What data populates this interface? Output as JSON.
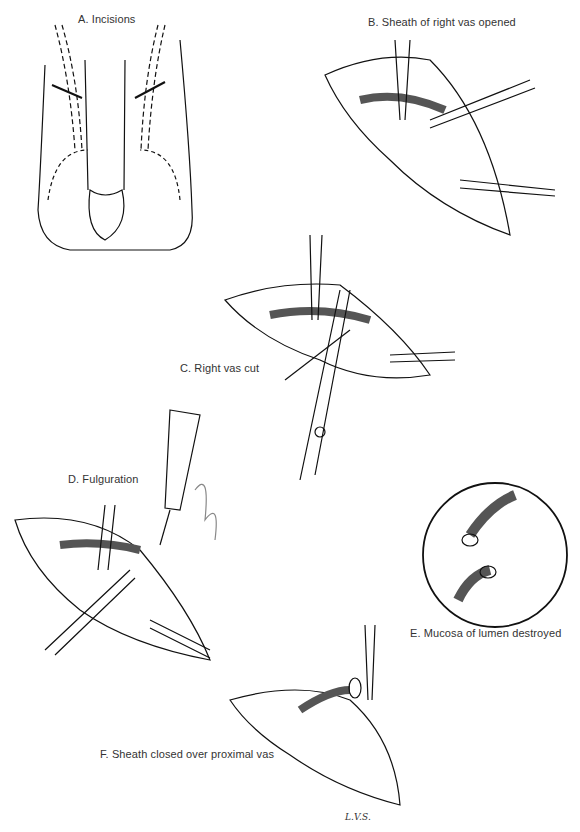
{
  "figure": {
    "panels": [
      {
        "id": "A",
        "label": "A. Incisions"
      },
      {
        "id": "B",
        "label": "B. Sheath of right vas opened"
      },
      {
        "id": "C",
        "label": "C. Right vas cut"
      },
      {
        "id": "D",
        "label": "D. Fulguration"
      },
      {
        "id": "E",
        "label": "E. Mucosa of lumen destroyed"
      },
      {
        "id": "F",
        "label": "F. Sheath closed over proximal vas"
      }
    ],
    "signature": "L.V.S."
  }
}
